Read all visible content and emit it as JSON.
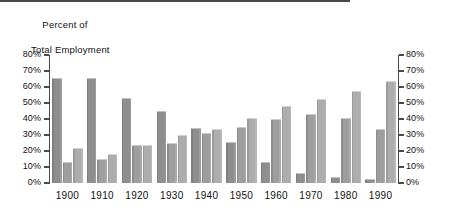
{
  "chart_data": {
    "type": "bar",
    "title": "Percent of Total Employment",
    "title_line1": "Percent of",
    "title_line2": "Total Employment",
    "xlabel": "",
    "ylabel": "Percent of Total Employment",
    "ylim": [
      0,
      80
    ],
    "grid": false,
    "legend_position": "none",
    "dual_axis": true,
    "categories": [
      "1900",
      "1910",
      "1920",
      "1930",
      "1940",
      "1950",
      "1960",
      "1970",
      "1980",
      "1990"
    ],
    "ytick_labels": [
      "0%",
      "10%",
      "20%",
      "30%",
      "40%",
      "50%",
      "60%",
      "70%",
      "80%"
    ],
    "ytick_values": [
      0,
      10,
      20,
      30,
      40,
      50,
      60,
      70,
      80
    ],
    "right_ytick_labels": [
      "0%",
      "10%",
      "20%",
      "30%",
      "40%",
      "50%",
      "60%",
      "70%",
      "80%"
    ],
    "series": [
      {
        "name": "Series 1",
        "color": "#8e8e8e",
        "values": [
          65.5,
          65.5,
          53.0,
          45.0,
          34.5,
          25.5,
          13.0,
          6.0,
          3.5,
          2.5
        ]
      },
      {
        "name": "Series 2",
        "color": "#9e9e9e",
        "values": [
          13.0,
          15.0,
          24.0,
          25.0,
          31.5,
          35.0,
          40.0,
          43.0,
          40.5,
          33.5
        ]
      },
      {
        "name": "Series 3",
        "color": "#adadad",
        "values": [
          22.0,
          18.0,
          23.5,
          30.0,
          34.0,
          40.5,
          48.0,
          52.5,
          57.5,
          63.5
        ]
      }
    ]
  },
  "axis": {
    "line_color": "#4a4a4a",
    "label_color": "#111111"
  }
}
